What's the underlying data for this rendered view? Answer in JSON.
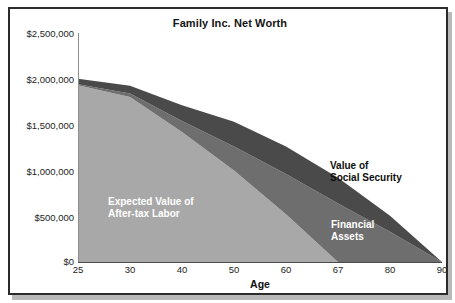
{
  "chart_data": {
    "type": "area",
    "stacked": true,
    "title": "Family Inc. Net Worth",
    "xlabel": "Age",
    "ylabel": "",
    "grid": false,
    "legend_position": "inline-annotations",
    "categories": [
      25,
      30,
      40,
      50,
      60,
      67,
      80,
      90
    ],
    "category_tick_labels": [
      "25",
      "30",
      "40",
      "50",
      "60",
      "67",
      "80",
      "90"
    ],
    "ylim": [
      0,
      2500000
    ],
    "ytick_labels": [
      "$2,500,000",
      "$2,000,000",
      "$1,500,000",
      "$1,000,000",
      "$500,000",
      "$0"
    ],
    "ytick_values": [
      2500000,
      2000000,
      1500000,
      1000000,
      500000,
      0
    ],
    "series": [
      {
        "name": "Expected Value of After-tax Labor",
        "color": "#a8a8a8",
        "label_color": "#ffffff",
        "values": [
          1930000,
          1800000,
          1420000,
          1000000,
          520000,
          0,
          0,
          0
        ]
      },
      {
        "name": "Financial Assets",
        "color": "#6e6e6e",
        "label_color": "#ffffff",
        "values": [
          10000,
          40000,
          120000,
          260000,
          440000,
          640000,
          330000,
          0
        ]
      },
      {
        "name": "Value of Social Security",
        "color": "#4a4a4a",
        "label_color": "#0d0d0d",
        "values": [
          60000,
          85000,
          170000,
          270000,
          300000,
          280000,
          175000,
          0
        ]
      }
    ],
    "stack_totals": [
      2000000,
      1925000,
      1710000,
      1530000,
      1260000,
      920000,
      505000,
      0
    ]
  },
  "annotations": {
    "labor": "Expected Value of\nAfter-tax Labor",
    "social_security": "Value of\nSocial Security",
    "financial_assets": "Financial\nAssets"
  },
  "colors": {
    "labor": "#a8a8a8",
    "financial_assets": "#6e6e6e",
    "social_security": "#4a4a4a",
    "frame": "#2b2b2b",
    "axis": "#4a4a4a",
    "background": "#ffffff"
  }
}
